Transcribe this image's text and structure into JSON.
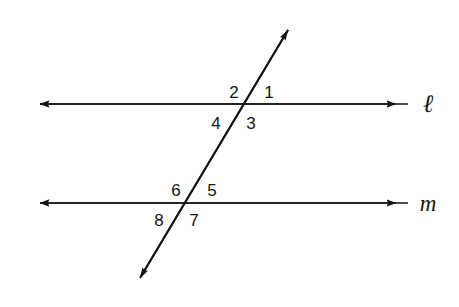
{
  "figure": {
    "type": "geometry-diagram",
    "background_color": "#ffffff",
    "stroke_color": "#141414"
  },
  "lines": [
    {
      "id": "line-l",
      "label": "ℓ",
      "label_style": "script-italic",
      "orientation": "horizontal",
      "y": 104,
      "x_start": 28,
      "x_end": 408,
      "arrows": "both",
      "label_x": 428,
      "label_y": 103
    },
    {
      "id": "line-m",
      "label": "m",
      "label_style": "italic",
      "orientation": "horizontal",
      "y": 203,
      "x_start": 28,
      "x_end": 408,
      "arrows": "both",
      "label_x": 428,
      "label_y": 203
    },
    {
      "id": "transversal",
      "label": "",
      "orientation": "diagonal",
      "x_start": 132,
      "y_start": 292,
      "x_end": 295,
      "y_end": 18,
      "arrows": "both"
    }
  ],
  "intersections": [
    {
      "id": "intersection-upper",
      "line": "line-l",
      "x": 244,
      "y": 104
    },
    {
      "id": "intersection-lower",
      "line": "line-m",
      "x": 187,
      "y": 203
    }
  ],
  "angle_labels": [
    {
      "id": "angle-1",
      "text": "1",
      "x": 269,
      "y": 92,
      "position": "upper-right",
      "intersection": "intersection-upper"
    },
    {
      "id": "angle-2",
      "text": "2",
      "x": 234,
      "y": 92,
      "position": "upper-left",
      "intersection": "intersection-upper"
    },
    {
      "id": "angle-3",
      "text": "3",
      "x": 251,
      "y": 123,
      "position": "lower-right",
      "intersection": "intersection-upper"
    },
    {
      "id": "angle-4",
      "text": "4",
      "x": 216,
      "y": 123,
      "position": "lower-left",
      "intersection": "intersection-upper"
    },
    {
      "id": "angle-5",
      "text": "5",
      "x": 212,
      "y": 190,
      "position": "upper-right",
      "intersection": "intersection-lower"
    },
    {
      "id": "angle-6",
      "text": "6",
      "x": 176,
      "y": 190,
      "position": "upper-left",
      "intersection": "intersection-lower"
    },
    {
      "id": "angle-7",
      "text": "7",
      "x": 194,
      "y": 220,
      "position": "lower-right",
      "intersection": "intersection-lower"
    },
    {
      "id": "angle-8",
      "text": "8",
      "x": 159,
      "y": 220,
      "position": "lower-left",
      "intersection": "intersection-lower"
    }
  ]
}
